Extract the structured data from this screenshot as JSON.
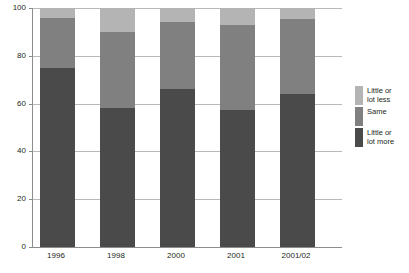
{
  "chart_data": {
    "type": "bar",
    "subtype": "stacked-bar-100",
    "title": "",
    "subtitle": "",
    "xlabel": "",
    "ylabel": "",
    "categories": [
      "1996",
      "1998",
      "2000",
      "2001",
      "2001/02"
    ],
    "series": [
      {
        "name": "Little or lot more",
        "color": "#4a4a4a",
        "values": [
          75,
          58,
          66,
          57.5,
          64
        ]
      },
      {
        "name": "Same",
        "color": "#808080",
        "values": [
          21,
          32,
          28,
          35.5,
          31.5
        ]
      },
      {
        "name": "Little or lot less",
        "color": "#b4b4b4",
        "values": [
          4,
          10,
          6,
          7,
          4.5
        ]
      }
    ],
    "stack_tops": {
      "little_or_lot_more": [
        75,
        58,
        66,
        57.5,
        64
      ],
      "same_cumulative": [
        96,
        90,
        94,
        93,
        95.5
      ],
      "total": [
        100,
        100,
        100,
        100,
        100
      ]
    },
    "ylim": [
      0,
      100
    ],
    "yticks": [
      0,
      20,
      40,
      60,
      80,
      100
    ],
    "ytick_labels": [
      "0",
      "20",
      "40",
      "60",
      "80",
      "100"
    ],
    "grid": true,
    "grid_axis": "y",
    "legend_position": "right",
    "legend": [
      {
        "label": "Little or\nlot less",
        "color": "#b4b4b4"
      },
      {
        "label": "Same",
        "color": "#808080"
      },
      {
        "label": "Little or\nlot more",
        "color": "#4a4a4a"
      }
    ]
  },
  "colors": {
    "background": "#ffffff",
    "axis": "#8d8d8d",
    "grid": "#b9b9b9",
    "text": "#231f20",
    "series_light": "#b4b4b4",
    "series_mid": "#808080",
    "series_dark": "#4a4a4a"
  }
}
